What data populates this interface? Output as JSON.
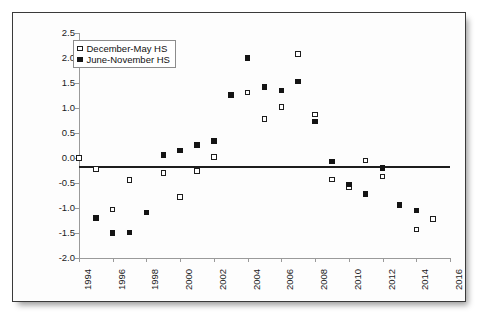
{
  "chart_data": {
    "type": "scatter",
    "title": "",
    "subtitle": "",
    "xlabel": "",
    "ylabel": "",
    "xlim": [
      1994,
      2016
    ],
    "ylim": [
      -2.0,
      2.5
    ],
    "xticks": [
      1994,
      1996,
      1998,
      2000,
      2002,
      2004,
      2006,
      2008,
      2010,
      2012,
      2014,
      2016
    ],
    "yticks": [
      -2.0,
      -1.5,
      -1.0,
      -0.5,
      0.0,
      0.5,
      1.0,
      1.5,
      2.0,
      2.5
    ],
    "grid": false,
    "zero_line": true,
    "legend_position": "top-left",
    "series": [
      {
        "name": "December-May HS",
        "marker": "open-square",
        "color": "#1d1d1d",
        "points": [
          {
            "x": 1994,
            "y": 0.0
          },
          {
            "x": 1995,
            "y": -0.22
          },
          {
            "x": 1996,
            "y": -1.03
          },
          {
            "x": 1997,
            "y": -0.44
          },
          {
            "x": 1999,
            "y": -0.3
          },
          {
            "x": 2000,
            "y": -0.78
          },
          {
            "x": 2001,
            "y": -0.26
          },
          {
            "x": 2002,
            "y": 0.02
          },
          {
            "x": 2004,
            "y": 1.31
          },
          {
            "x": 2005,
            "y": 0.78
          },
          {
            "x": 2006,
            "y": 1.02
          },
          {
            "x": 2007,
            "y": 2.08
          },
          {
            "x": 2008,
            "y": 0.87
          },
          {
            "x": 2009,
            "y": -0.43
          },
          {
            "x": 2010,
            "y": -0.58
          },
          {
            "x": 2011,
            "y": -0.05
          },
          {
            "x": 2012,
            "y": -0.37
          },
          {
            "x": 2014,
            "y": -1.43
          },
          {
            "x": 2015,
            "y": -1.22
          }
        ]
      },
      {
        "name": "June-November HS",
        "marker": "filled-square",
        "color": "#141414",
        "points": [
          {
            "x": 1995,
            "y": -1.2
          },
          {
            "x": 1996,
            "y": -1.5
          },
          {
            "x": 1997,
            "y": -1.49
          },
          {
            "x": 1998,
            "y": -1.09
          },
          {
            "x": 1999,
            "y": 0.06
          },
          {
            "x": 2000,
            "y": 0.15
          },
          {
            "x": 2001,
            "y": 0.26
          },
          {
            "x": 2002,
            "y": 0.34
          },
          {
            "x": 2003,
            "y": 1.26
          },
          {
            "x": 2004,
            "y": 2.0
          },
          {
            "x": 2005,
            "y": 1.42
          },
          {
            "x": 2006,
            "y": 1.35
          },
          {
            "x": 2007,
            "y": 1.53
          },
          {
            "x": 2008,
            "y": 0.73
          },
          {
            "x": 2009,
            "y": -0.07
          },
          {
            "x": 2010,
            "y": -0.53
          },
          {
            "x": 2011,
            "y": -0.72
          },
          {
            "x": 2012,
            "y": -0.2
          },
          {
            "x": 2013,
            "y": -0.94
          },
          {
            "x": 2014,
            "y": -1.05
          }
        ]
      }
    ]
  },
  "legend": {
    "entries": [
      {
        "label": "December-May HS",
        "marker": "open-square"
      },
      {
        "label": "June-November HS",
        "marker": "filled-square"
      }
    ]
  }
}
